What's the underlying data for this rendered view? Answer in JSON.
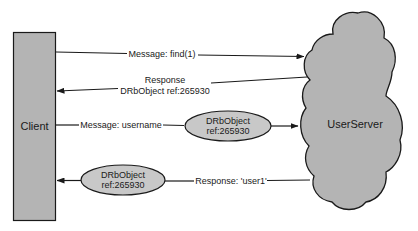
{
  "diagram": {
    "client": {
      "label": "Client"
    },
    "server": {
      "label": "UserServer"
    },
    "messages": [
      {
        "label": "Message: find(1)",
        "direction": "client-to-server"
      },
      {
        "label_line1": "Response",
        "label_line2": "DRbObject ref:265930",
        "direction": "server-to-client"
      },
      {
        "label": "Message: username",
        "direction": "client-to-server",
        "object": {
          "line1": "DRbObject",
          "line2": "ref:265930"
        }
      },
      {
        "label": "Response: 'user1'",
        "direction": "server-to-client",
        "object": {
          "line1": "DRbObject",
          "line2": "ref:265930"
        }
      }
    ],
    "colors": {
      "shape_fill": "#b4b4b4",
      "ellipse_fill": "#c8c8c8",
      "stroke": "#1a1a1a",
      "background": "#ffffff"
    }
  }
}
